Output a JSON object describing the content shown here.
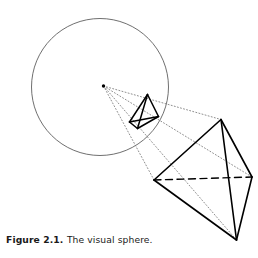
{
  "figure": {
    "caption_label": "Figure 2.1.",
    "caption_text": "The visual sphere.",
    "title": "The visual sphere",
    "colors": {
      "background": "#ffffff",
      "sphere_outline": "#555555",
      "solid_outline": "#000000",
      "projection_ray": "#7a7a7a",
      "hidden_edge": "#000000",
      "caption_text": "#1a1a1a"
    },
    "line_styles": {
      "sphere": "solid-thin",
      "object_edges": "solid-thick",
      "projection_rays": "dotted",
      "hidden_edge": "dashed"
    },
    "viewpoint": {
      "label": "eye-point",
      "x": 103.5,
      "y": 86.0,
      "radius": 1.7
    },
    "sphere": {
      "label": "visual-sphere",
      "cx": 100.0,
      "cy": 87.0,
      "r": 68.5,
      "stroke_width": 0.85
    },
    "projected_tetrahedron": {
      "label": "projected-image-on-sphere",
      "vertices": [
        {
          "name": "top",
          "x": 147.5,
          "y": 94.5
        },
        {
          "name": "left",
          "x": 129.5,
          "y": 122.0
        },
        {
          "name": "bottom",
          "x": 137.5,
          "y": 128.5
        },
        {
          "name": "right",
          "x": 158.5,
          "y": 116.5
        }
      ],
      "edges": [
        [
          0,
          1
        ],
        [
          0,
          2
        ],
        [
          0,
          3
        ],
        [
          1,
          2
        ],
        [
          1,
          3
        ],
        [
          2,
          3
        ]
      ],
      "stroke_width": 1.5
    },
    "object_tetrahedron": {
      "label": "object-tetrahedron",
      "vertices": [
        {
          "name": "top",
          "x": 221.0,
          "y": 119.5
        },
        {
          "name": "left",
          "x": 154.0,
          "y": 180.0
        },
        {
          "name": "bottom",
          "x": 236.5,
          "y": 240.0
        },
        {
          "name": "right",
          "x": 252.0,
          "y": 177.0
        }
      ],
      "visible_edges": [
        [
          0,
          1
        ],
        [
          0,
          2
        ],
        [
          0,
          3
        ],
        [
          1,
          2
        ],
        [
          2,
          3
        ]
      ],
      "hidden_edges": [
        [
          1,
          3
        ]
      ],
      "stroke_width": 1.6
    },
    "projection_rays": {
      "label": "sight-lines",
      "from": {
        "x": 103.5,
        "y": 86.0
      },
      "to": [
        {
          "x": 221.0,
          "y": 119.5
        },
        {
          "x": 154.0,
          "y": 180.0
        },
        {
          "x": 236.5,
          "y": 240.0
        },
        {
          "x": 252.0,
          "y": 177.0
        }
      ],
      "stroke_width": 0.85,
      "dash": "1,2.2"
    }
  }
}
